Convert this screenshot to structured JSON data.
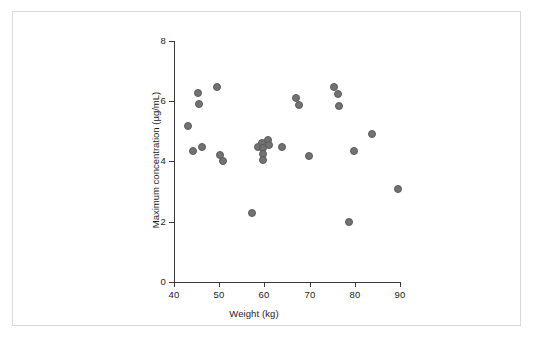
{
  "figure": {
    "background_color": "#ffffff",
    "border_color": "#d8d8d8",
    "point_color": "#727272",
    "axis_color": "#3a3a3a"
  },
  "chart_data": {
    "type": "scatter",
    "title": "",
    "xlabel": "Weight (kg)",
    "ylabel": "Maximum concentration (µg/mL)",
    "xlim": [
      40,
      90
    ],
    "ylim": [
      0,
      8
    ],
    "xticks": [
      40,
      50,
      60,
      70,
      80,
      90
    ],
    "yticks": [
      0,
      2,
      4,
      6,
      8
    ],
    "xtick_labels": [
      "40",
      "50",
      "60",
      "70",
      "80",
      "90"
    ],
    "ytick_labels": [
      "0",
      "2",
      "4",
      "6",
      "8"
    ],
    "grid": false,
    "legend": null,
    "marker": "circle",
    "marker_color": "#727272",
    "n_points": 31,
    "points": [
      {
        "x": 43.1,
        "y": 5.18
      },
      {
        "x": 44.2,
        "y": 4.35
      },
      {
        "x": 45.4,
        "y": 6.28
      },
      {
        "x": 45.5,
        "y": 5.9
      },
      {
        "x": 46.3,
        "y": 4.48
      },
      {
        "x": 49.6,
        "y": 6.48
      },
      {
        "x": 50.2,
        "y": 4.22
      },
      {
        "x": 50.8,
        "y": 4.02
      },
      {
        "x": 57.2,
        "y": 2.28
      },
      {
        "x": 58.6,
        "y": 4.48
      },
      {
        "x": 59.4,
        "y": 4.62
      },
      {
        "x": 59.6,
        "y": 4.45
      },
      {
        "x": 59.7,
        "y": 4.25
      },
      {
        "x": 59.8,
        "y": 4.05
      },
      {
        "x": 60.8,
        "y": 4.72
      },
      {
        "x": 61.0,
        "y": 4.55
      },
      {
        "x": 63.9,
        "y": 4.48
      },
      {
        "x": 66.9,
        "y": 6.1
      },
      {
        "x": 67.6,
        "y": 5.88
      },
      {
        "x": 69.9,
        "y": 4.18
      },
      {
        "x": 75.3,
        "y": 6.48
      },
      {
        "x": 76.2,
        "y": 6.25
      },
      {
        "x": 76.4,
        "y": 5.85
      },
      {
        "x": 78.8,
        "y": 1.98
      },
      {
        "x": 79.9,
        "y": 4.35
      },
      {
        "x": 83.8,
        "y": 4.92
      },
      {
        "x": 89.6,
        "y": 3.08
      }
    ]
  }
}
